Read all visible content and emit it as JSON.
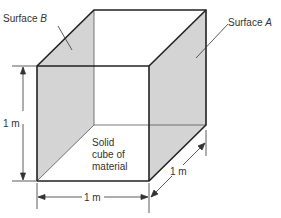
{
  "diagram": {
    "labels": {
      "surface_b_prefix": "Surface ",
      "surface_b_letter": "B",
      "surface_a_prefix": "Surface ",
      "surface_a_letter": "A",
      "body_line1": "Solid",
      "body_line2": "cube of",
      "body_line3": "material"
    },
    "dimensions": {
      "height": "1 m",
      "width": "1 m",
      "depth": "1 m"
    },
    "colors": {
      "shade": "#d4d4d4",
      "edge": "#222222",
      "background": "#ffffff"
    }
  }
}
